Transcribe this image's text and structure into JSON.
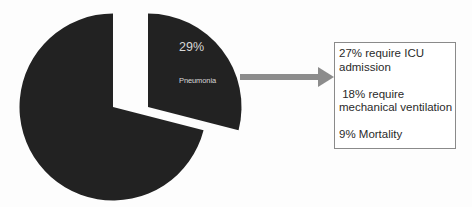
{
  "chart_data": {
    "type": "pie",
    "title": "",
    "categories": [
      "Other",
      "Pneumonia"
    ],
    "values": [
      71,
      29
    ],
    "exploded": [
      "Pneumonia"
    ],
    "data_labels": [
      {
        "category": "Pneumonia",
        "value_label": "29%",
        "name_label": "Pneumonia"
      }
    ],
    "colors": {
      "slice": "#222222",
      "label": "#d8d8d8"
    },
    "legend": "none",
    "annotation": {
      "type": "arrow-callout",
      "from": "Pneumonia",
      "arrow_color": "#8c8c8c",
      "lines": [
        "27% require ICU",
        "admission",
        "",
        " 18% require",
        "mechanical ventilation",
        "",
        "9% Mortality"
      ]
    }
  },
  "pie": {
    "pneumonia_percent": "29%",
    "pneumonia_name": "Pneumonia"
  },
  "callout": {
    "lines": [
      "27% require ICU",
      "admission",
      "",
      " 18% require",
      "mechanical ventilation",
      "",
      "9% Mortality"
    ]
  }
}
